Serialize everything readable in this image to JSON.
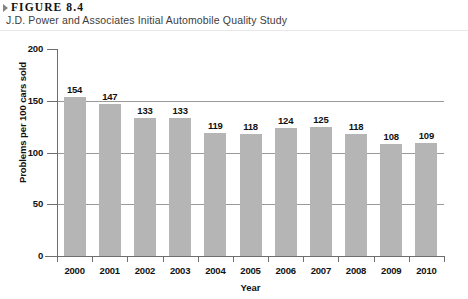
{
  "figure": {
    "marker_icon": "triangle-right-icon",
    "label": "FIGURE 8.4",
    "subtitle": "J.D. Power and Associates Initial Automobile Quality Study"
  },
  "chart_data": {
    "type": "bar",
    "title": "J.D. Power and Associates Initial Automobile Quality Study",
    "categories": [
      "2000",
      "2001",
      "2002",
      "2003",
      "2004",
      "2005",
      "2006",
      "2007",
      "2008",
      "2009",
      "2010"
    ],
    "values": [
      154,
      147,
      133,
      133,
      119,
      118,
      124,
      125,
      118,
      108,
      109
    ],
    "xlabel": "Year",
    "ylabel": "Problems per 100 cars sold",
    "ylim": [
      0,
      200
    ],
    "yticks": [
      "0",
      "50",
      "100",
      "150",
      "200"
    ],
    "gridlines": [
      50,
      100,
      150,
      200
    ],
    "grid": true,
    "legend": "none",
    "bar_color": "#b5b5b5",
    "axis_color": "#6e6e6e",
    "grid_color": "#9a9a9a"
  }
}
